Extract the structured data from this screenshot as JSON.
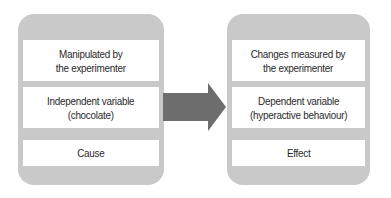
{
  "diagram": {
    "left_panel": {
      "cells": [
        {
          "text": "Manipulated by\nthe experimenter"
        },
        {
          "text": "Independent variable\n(chocolate)"
        },
        {
          "text": "Cause"
        }
      ]
    },
    "arrow": {
      "direction": "right",
      "color": "#6d6d6d"
    },
    "right_panel": {
      "cells": [
        {
          "text": "Changes measured by\nthe experimenter"
        },
        {
          "text": "Dependent variable\n(hyperactive behaviour)"
        },
        {
          "text": "Effect"
        }
      ]
    },
    "colors": {
      "panel": "#c9c9c9",
      "cell": "#ffffff",
      "text": "#2a2a2a",
      "arrow": "#6d6d6d"
    }
  }
}
